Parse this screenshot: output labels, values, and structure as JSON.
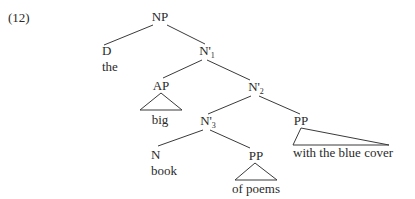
{
  "example_number": "(12)",
  "tree": {
    "root": {
      "label": "NP"
    },
    "d": {
      "label": "D",
      "word": "the"
    },
    "nbar1": {
      "label": "N'",
      "subscript": "1"
    },
    "ap": {
      "label": "AP",
      "word": "big"
    },
    "nbar2": {
      "label": "N'",
      "subscript": "2"
    },
    "nbar3": {
      "label": "N'",
      "subscript": "3"
    },
    "pp_right": {
      "label": "PP",
      "word": "with the blue cover"
    },
    "n": {
      "label": "N",
      "word": "book"
    },
    "pp_inner": {
      "label": "PP",
      "word": "of poems"
    }
  },
  "structure": "[NP [D the] [N'1 [AP big] [N'2 [N'3 [N book] [PP of poems]] [PP with the blue cover]]]]",
  "colors": {
    "ink": "#2a2a2a",
    "background": "#ffffff"
  }
}
